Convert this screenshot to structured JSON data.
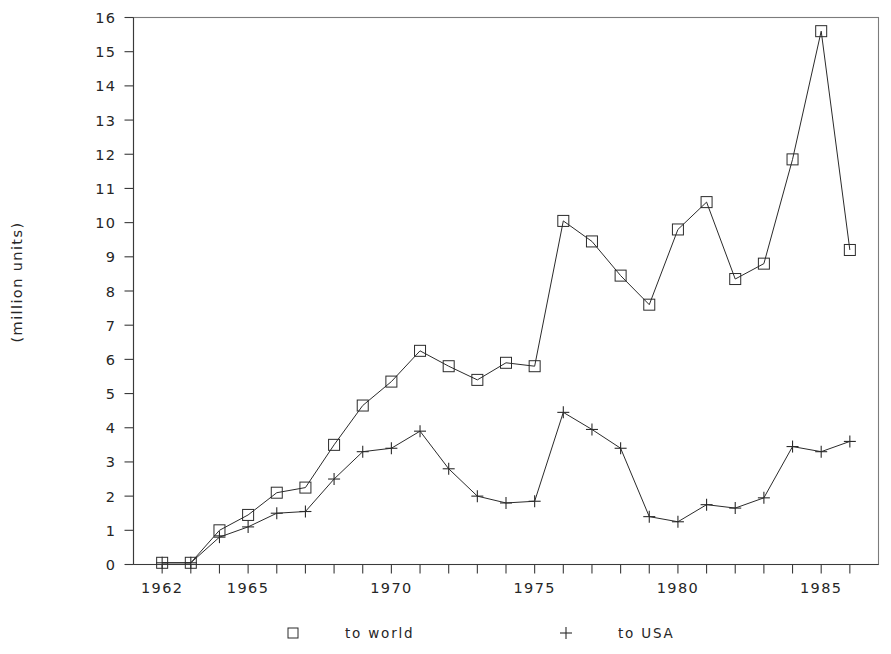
{
  "figure": {
    "clipped_title": "",
    "background_color": "#ffffff",
    "ink_color": "#2b2b2b",
    "frame_color": "#7c7c7c"
  },
  "axes": {
    "y_axis_title": "(million units)",
    "y_tick_labels": [
      "0",
      "1",
      "2",
      "3",
      "4",
      "5",
      "6",
      "7",
      "8",
      "9",
      "10",
      "11",
      "12",
      "13",
      "14",
      "15",
      "16"
    ],
    "x_tick_labels": [
      "1962",
      "1965",
      "1970",
      "1975",
      "1980",
      "1985"
    ]
  },
  "legend": {
    "entries": [
      {
        "marker": "square-marker",
        "label": "to world"
      },
      {
        "marker": "plus-marker",
        "label": "to USA"
      }
    ]
  },
  "chart_data": {
    "type": "line",
    "title": "",
    "xlabel": "",
    "ylabel": "(million units)",
    "xlim": [
      1961,
      1987
    ],
    "ylim": [
      0,
      16
    ],
    "grid": false,
    "legend_position": "bottom",
    "x": [
      1962,
      1963,
      1964,
      1965,
      1966,
      1967,
      1968,
      1969,
      1970,
      1971,
      1972,
      1973,
      1974,
      1975,
      1976,
      1977,
      1978,
      1979,
      1980,
      1981,
      1982,
      1983,
      1984,
      1985,
      1986
    ],
    "series": [
      {
        "name": "to world",
        "marker": "square",
        "values": [
          0.05,
          0.05,
          1.0,
          1.45,
          2.1,
          2.25,
          3.5,
          4.65,
          5.35,
          6.25,
          5.8,
          5.4,
          5.9,
          5.8,
          10.05,
          9.45,
          8.45,
          7.6,
          9.8,
          10.6,
          8.35,
          8.8,
          11.85,
          15.6,
          9.2
        ]
      },
      {
        "name": "to USA",
        "marker": "plus",
        "values": [
          0.05,
          0.05,
          0.8,
          1.1,
          1.5,
          1.55,
          2.5,
          3.3,
          3.4,
          3.9,
          2.8,
          2.0,
          1.8,
          1.85,
          4.45,
          3.95,
          3.4,
          1.4,
          1.25,
          1.75,
          1.65,
          1.95,
          3.45,
          3.3,
          3.6
        ]
      }
    ]
  }
}
